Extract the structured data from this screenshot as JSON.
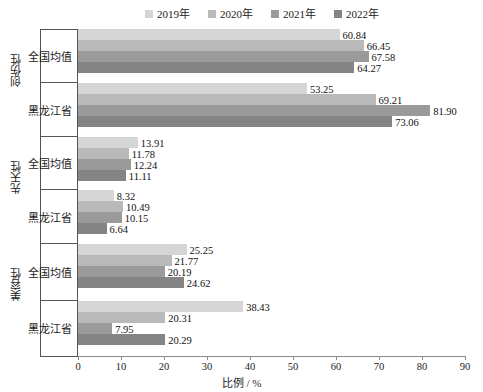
{
  "chart_data": {
    "type": "bar",
    "orientation": "horizontal",
    "title": "",
    "xlabel": "比例 / %",
    "ylabel": "",
    "xlim": [
      0,
      90
    ],
    "xticks": [
      0,
      10,
      20,
      30,
      40,
      50,
      60,
      70,
      80,
      90
    ],
    "grid": false,
    "legend_position": "top",
    "legend": [
      "2019年",
      "2020年",
      "2021年",
      "2022年"
    ],
    "series_colors": [
      "#d5d5d5",
      "#b9b9b9",
      "#9a9a9a",
      "#848484"
    ],
    "group_labels": [
      "创伤性",
      "先天性",
      "美容性"
    ],
    "sub_labels": [
      "全国均值",
      "黑龙江省"
    ],
    "categories": [
      "创伤性 / 全国均值",
      "创伤性 / 黑龙江省",
      "先天性 / 全国均值",
      "先天性 / 黑龙江省",
      "美容性 / 全国均值",
      "美容性 / 黑龙江省"
    ],
    "series": [
      {
        "name": "2019年",
        "values": [
          60.84,
          53.25,
          13.91,
          8.32,
          25.25,
          38.43
        ]
      },
      {
        "name": "2020年",
        "values": [
          66.45,
          69.21,
          11.78,
          10.49,
          21.77,
          20.31
        ]
      },
      {
        "name": "2021年",
        "values": [
          67.58,
          81.9,
          12.24,
          10.15,
          20.19,
          7.95
        ]
      },
      {
        "name": "2022年",
        "values": [
          64.27,
          73.06,
          11.11,
          6.64,
          24.62,
          20.29
        ]
      }
    ],
    "data_labels": [
      [
        "60.84",
        "66.45",
        "67.58",
        "64.27"
      ],
      [
        "53.25",
        "69.21",
        "81.90",
        "73.06"
      ],
      [
        "13.91",
        "11.78",
        "12.24",
        "11.11"
      ],
      [
        "8.32",
        "10.49",
        "10.15",
        "6.64"
      ],
      [
        "25.25",
        "21.77",
        "20.19",
        "24.62"
      ],
      [
        "38.43",
        "20.31",
        "7.95",
        "20.29"
      ]
    ]
  },
  "legend": {
    "items": [
      {
        "label": "2019年",
        "color": "#d5d5d5"
      },
      {
        "label": "2020年",
        "color": "#b9b9b9"
      },
      {
        "label": "2021年",
        "color": "#9a9a9a"
      },
      {
        "label": "2022年",
        "color": "#848484"
      }
    ]
  },
  "axis": {
    "x_title": "比例 / %",
    "ticks": [
      "0",
      "10",
      "20",
      "30",
      "40",
      "50",
      "60",
      "70",
      "80",
      "90"
    ]
  },
  "y_axis": {
    "groups": [
      {
        "label": "创伤性",
        "subs": [
          "全国均值",
          "黑龙江省"
        ]
      },
      {
        "label": "先天性",
        "subs": [
          "全国均值",
          "黑龙江省"
        ]
      },
      {
        "label": "美容性",
        "subs": [
          "全国均值",
          "黑龙江省"
        ]
      }
    ]
  }
}
